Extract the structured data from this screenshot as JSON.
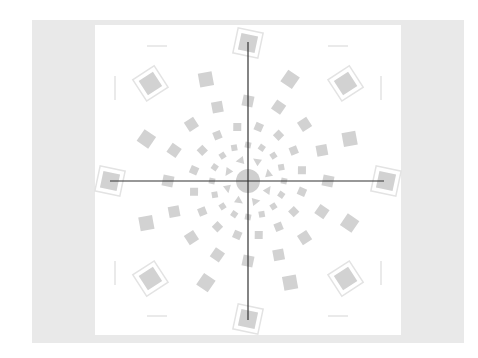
{
  "figure": {
    "colors": {
      "background_band": "#e9e9e9",
      "panel": "#ffffff",
      "shape_fill": "#d2d2d2",
      "shape_outline": "#e3e3e3",
      "crosshair": "#333333",
      "center_disc": "#cfcfcf"
    },
    "center": {
      "x": 248,
      "y": 181
    },
    "crosshair": {
      "vertical": {
        "x": 248,
        "y1": 42,
        "y2": 320
      },
      "horizontal": {
        "y": 181,
        "x1": 110,
        "x2": 384
      }
    },
    "center_disc_radius": 12,
    "rings": [
      {
        "radius": 22,
        "size": 4,
        "shape": "triangle",
        "count": 8,
        "offset_deg": 22.5
      },
      {
        "radius": 36,
        "size": 6,
        "shape": "square",
        "count": 16,
        "offset_deg": 0
      },
      {
        "radius": 55,
        "size": 8,
        "shape": "square",
        "count": 16,
        "offset_deg": 11.25
      },
      {
        "radius": 80,
        "size": 11,
        "shape": "square",
        "count": 16,
        "offset_deg": 0
      },
      {
        "radius": 110,
        "size": 14,
        "shape": "square",
        "count": 8,
        "offset_deg": 22.5
      },
      {
        "radius": 138,
        "size": 17,
        "shape": "square_outlined",
        "count": 8,
        "offset_deg": 0
      }
    ],
    "edge_ticks": [
      {
        "x": 157,
        "y": 46,
        "orient": "h"
      },
      {
        "x": 338,
        "y": 46,
        "orient": "h"
      },
      {
        "x": 157,
        "y": 316,
        "orient": "h"
      },
      {
        "x": 338,
        "y": 316,
        "orient": "h"
      },
      {
        "x": 115,
        "y": 88,
        "orient": "v"
      },
      {
        "x": 381,
        "y": 88,
        "orient": "v"
      },
      {
        "x": 115,
        "y": 273,
        "orient": "v"
      },
      {
        "x": 381,
        "y": 273,
        "orient": "v"
      }
    ]
  }
}
